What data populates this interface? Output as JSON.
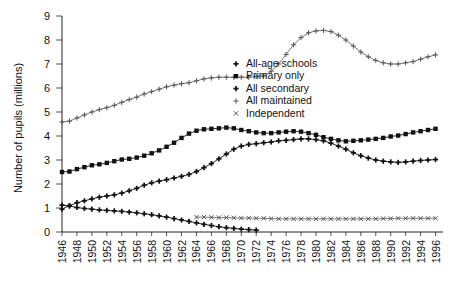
{
  "chart_data": {
    "type": "line",
    "title": "",
    "xlabel": "",
    "ylabel": "Number of pupils (millions)",
    "ylim": [
      0,
      9
    ],
    "yticks": [
      0,
      1,
      2,
      3,
      4,
      5,
      6,
      7,
      8,
      9
    ],
    "ytick_labels": [
      "0",
      "1",
      "2",
      "3",
      "4",
      "5",
      "6",
      "7",
      "8",
      "9"
    ],
    "xlim": [
      1946,
      1997
    ],
    "xtick_labels": [
      "1946",
      "1948",
      "1950",
      "1952",
      "1954",
      "1956",
      "1958",
      "1960",
      "1962",
      "1964",
      "1966",
      "1968",
      "1970",
      "1972",
      "1974",
      "1976",
      "1978",
      "1980",
      "1982",
      "1984",
      "1986",
      "1988",
      "1990",
      "1992",
      "1994",
      "1996"
    ],
    "grid": false,
    "legend_position": "center",
    "series": [
      {
        "name": "All-age schools",
        "marker": "plus",
        "x": [
          1946,
          1947,
          1948,
          1949,
          1950,
          1951,
          1952,
          1953,
          1954,
          1955,
          1956,
          1957,
          1958,
          1959,
          1960,
          1961,
          1962,
          1963,
          1964,
          1965,
          1966,
          1967,
          1968,
          1969,
          1970,
          1971,
          1972
        ],
        "values": [
          1.12,
          1.08,
          1.02,
          0.98,
          0.95,
          0.92,
          0.9,
          0.88,
          0.86,
          0.83,
          0.8,
          0.76,
          0.72,
          0.67,
          0.62,
          0.56,
          0.5,
          0.44,
          0.38,
          0.32,
          0.27,
          0.22,
          0.18,
          0.15,
          0.12,
          0.1,
          0.08
        ]
      },
      {
        "name": "Primary only",
        "marker": "square",
        "x": [
          1946,
          1947,
          1948,
          1949,
          1950,
          1951,
          1952,
          1953,
          1954,
          1955,
          1956,
          1957,
          1958,
          1959,
          1960,
          1961,
          1962,
          1963,
          1964,
          1965,
          1966,
          1967,
          1968,
          1969,
          1970,
          1971,
          1972,
          1973,
          1974,
          1975,
          1976,
          1977,
          1978,
          1979,
          1980,
          1981,
          1982,
          1983,
          1984,
          1985,
          1986,
          1987,
          1988,
          1989,
          1990,
          1991,
          1992,
          1993,
          1994,
          1995,
          1996
        ],
        "values": [
          2.5,
          2.52,
          2.62,
          2.7,
          2.78,
          2.82,
          2.88,
          2.95,
          3.02,
          3.05,
          3.1,
          3.18,
          3.28,
          3.4,
          3.55,
          3.72,
          3.92,
          4.1,
          4.22,
          4.28,
          4.3,
          4.32,
          4.35,
          4.32,
          4.25,
          4.2,
          4.15,
          4.12,
          4.12,
          4.15,
          4.18,
          4.2,
          4.18,
          4.12,
          4.05,
          3.95,
          3.88,
          3.82,
          3.78,
          3.8,
          3.82,
          3.85,
          3.88,
          3.92,
          3.98,
          4.02,
          4.08,
          4.15,
          4.2,
          4.25,
          4.3
        ]
      },
      {
        "name": "All secondary",
        "marker": "plus",
        "x": [
          1946,
          1947,
          1948,
          1949,
          1950,
          1951,
          1952,
          1953,
          1954,
          1955,
          1956,
          1957,
          1958,
          1959,
          1960,
          1961,
          1962,
          1963,
          1964,
          1965,
          1966,
          1967,
          1968,
          1969,
          1970,
          1971,
          1972,
          1973,
          1974,
          1975,
          1976,
          1977,
          1978,
          1979,
          1980,
          1981,
          1982,
          1983,
          1984,
          1985,
          1986,
          1987,
          1988,
          1989,
          1990,
          1991,
          1992,
          1993,
          1994,
          1995,
          1996
        ],
        "values": [
          0.95,
          1.1,
          1.22,
          1.3,
          1.38,
          1.45,
          1.5,
          1.55,
          1.62,
          1.72,
          1.82,
          1.95,
          2.05,
          2.12,
          2.18,
          2.25,
          2.32,
          2.4,
          2.52,
          2.68,
          2.85,
          3.05,
          3.25,
          3.45,
          3.58,
          3.65,
          3.68,
          3.72,
          3.75,
          3.8,
          3.82,
          3.85,
          3.88,
          3.88,
          3.85,
          3.8,
          3.7,
          3.58,
          3.45,
          3.3,
          3.18,
          3.08,
          3.0,
          2.95,
          2.92,
          2.9,
          2.92,
          2.95,
          2.98,
          3.0,
          3.02
        ]
      },
      {
        "name": "All maintained",
        "marker": "cross",
        "x": [
          1946,
          1947,
          1948,
          1949,
          1950,
          1951,
          1952,
          1953,
          1954,
          1955,
          1956,
          1957,
          1958,
          1959,
          1960,
          1961,
          1962,
          1963,
          1964,
          1965,
          1966,
          1967,
          1968,
          1969,
          1970,
          1971,
          1972,
          1973,
          1974,
          1975,
          1976,
          1977,
          1978,
          1979,
          1980,
          1981,
          1982,
          1983,
          1984,
          1985,
          1986,
          1987,
          1988,
          1989,
          1990,
          1991,
          1992,
          1993,
          1994,
          1995,
          1996
        ],
        "values": [
          4.58,
          4.62,
          4.75,
          4.88,
          5.0,
          5.1,
          5.18,
          5.28,
          5.4,
          5.52,
          5.62,
          5.75,
          5.85,
          5.95,
          6.05,
          6.12,
          6.18,
          6.22,
          6.3,
          6.38,
          6.42,
          6.45,
          6.45,
          6.45,
          6.45,
          6.45,
          6.48,
          6.5,
          6.7,
          7.0,
          7.4,
          7.8,
          8.1,
          8.3,
          8.38,
          8.4,
          8.35,
          8.2,
          8.0,
          7.75,
          7.5,
          7.3,
          7.15,
          7.05,
          7.0,
          7.0,
          7.05,
          7.1,
          7.2,
          7.3,
          7.38
        ]
      },
      {
        "name": "Independent",
        "marker": "x",
        "x": [
          1964,
          1965,
          1966,
          1967,
          1968,
          1969,
          1970,
          1971,
          1972,
          1973,
          1974,
          1975,
          1976,
          1977,
          1978,
          1979,
          1980,
          1981,
          1982,
          1983,
          1984,
          1985,
          1986,
          1987,
          1988,
          1989,
          1990,
          1991,
          1992,
          1993,
          1994,
          1995,
          1996
        ],
        "values": [
          0.62,
          0.62,
          0.61,
          0.6,
          0.6,
          0.59,
          0.58,
          0.58,
          0.57,
          0.57,
          0.56,
          0.55,
          0.55,
          0.55,
          0.55,
          0.55,
          0.55,
          0.55,
          0.55,
          0.55,
          0.55,
          0.55,
          0.55,
          0.55,
          0.55,
          0.56,
          0.56,
          0.57,
          0.57,
          0.57,
          0.57,
          0.57,
          0.57
        ]
      }
    ]
  },
  "legend": {
    "items": [
      {
        "label": "All-age schools",
        "marker": "plus"
      },
      {
        "label": "Primary only",
        "marker": "square"
      },
      {
        "label": "All secondary",
        "marker": "plus"
      },
      {
        "label": "All maintained",
        "marker": "cross"
      },
      {
        "label": "Independent",
        "marker": "x"
      }
    ]
  },
  "colors": {
    "axis": "#222222",
    "ink": "#111111",
    "light_ink": "#555555",
    "background": "#ffffff"
  }
}
